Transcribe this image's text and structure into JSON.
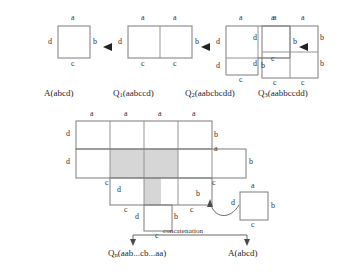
{
  "figure": {
    "title_present": false,
    "edge_labels": {
      "top": "a",
      "right": "b",
      "bottom": "c",
      "left": "d"
    },
    "top_row": {
      "steps": [
        {
          "id": "step-A",
          "caption_main": "A",
          "caption_sub": "",
          "caption_word": "(abcd)",
          "word": "abcd",
          "cols": 1,
          "rows": 1,
          "labels": [
            {
              "text": "a",
              "pos": "top"
            },
            {
              "text": "b",
              "pos": "right"
            },
            {
              "text": "c",
              "pos": "bottom"
            },
            {
              "text": "d",
              "pos": "left"
            }
          ]
        },
        {
          "id": "step-Q1",
          "caption_main": "Q",
          "caption_sub": "1",
          "caption_word": "(aabccd)",
          "word": "aabccd",
          "cols": 2,
          "rows": 1,
          "labels": [
            {
              "text": "a",
              "pos": "top-left"
            },
            {
              "text": "a",
              "pos": "top-right"
            },
            {
              "text": "b",
              "pos": "right"
            },
            {
              "text": "c",
              "pos": "bottom-left"
            },
            {
              "text": "c",
              "pos": "bottom-right"
            },
            {
              "text": "d",
              "pos": "left"
            }
          ]
        },
        {
          "id": "step-Q2",
          "caption_main": "Q",
          "caption_sub": "2",
          "caption_word": "(aabcbcdd)",
          "word": "aabcbcdd",
          "cols": 2,
          "rows": 2,
          "labels": [
            {
              "text": "a",
              "pos": "top-left"
            },
            {
              "text": "a",
              "pos": "top-right"
            },
            {
              "text": "b",
              "pos": "right-upper"
            },
            {
              "text": "c",
              "pos": "mid-right"
            },
            {
              "text": "b",
              "pos": "right-lower"
            },
            {
              "text": "c",
              "pos": "bottom-left"
            },
            {
              "text": "d",
              "pos": "left-upper"
            },
            {
              "text": "d",
              "pos": "left-lower"
            }
          ]
        },
        {
          "id": "step-Q3",
          "caption_main": "Q",
          "caption_sub": "3",
          "caption_word": "(aabbccdd)",
          "word": "aabbccdd",
          "cols": 2,
          "rows": 2,
          "labels": [
            {
              "text": "a",
              "pos": "top-left"
            },
            {
              "text": "a",
              "pos": "top-right"
            },
            {
              "text": "b",
              "pos": "right-upper"
            },
            {
              "text": "b",
              "pos": "right-lower"
            },
            {
              "text": "c",
              "pos": "bottom-left"
            },
            {
              "text": "c",
              "pos": "bottom-right"
            },
            {
              "text": "d",
              "pos": "left-upper"
            },
            {
              "text": "d",
              "pos": "left-lower"
            }
          ]
        }
      ],
      "arrow_glyph": "▶"
    },
    "bottom_figure": {
      "id": "polyomino-figure",
      "shaded_color": "#d6d6d6",
      "caption_main": "Q",
      "caption_sub": "n",
      "caption_word": "(aab...cb...aa)",
      "small_square": {
        "id": "small-square-A",
        "caption_main": "A",
        "caption_sub": "",
        "caption_word": "(abcd)",
        "labels": [
          {
            "text": "a",
            "pos": "top"
          },
          {
            "text": "b",
            "pos": "right"
          },
          {
            "text": "c",
            "pos": "bottom"
          },
          {
            "text": "d",
            "pos": "left"
          }
        ]
      },
      "labels": [
        {
          "text": "a",
          "pos": "top-1"
        },
        {
          "text": "a",
          "pos": "top-2"
        },
        {
          "text": "a",
          "pos": "top-3"
        },
        {
          "text": "a",
          "pos": "top-4"
        },
        {
          "text": "b",
          "pos": "right-row1"
        },
        {
          "text": "a",
          "pos": "right-notch-top"
        },
        {
          "text": "b",
          "pos": "right-row2"
        },
        {
          "text": "c",
          "pos": "right-row2-bottom"
        },
        {
          "text": "b",
          "pos": "right-row3"
        },
        {
          "text": "c",
          "pos": "right-row3-bottom"
        },
        {
          "text": "c",
          "pos": "bottom-stem-left"
        },
        {
          "text": "b",
          "pos": "stem-right"
        },
        {
          "text": "d",
          "pos": "stem-left"
        },
        {
          "text": "c",
          "pos": "stem-bottom"
        },
        {
          "text": "c",
          "pos": "left-notch-bottom"
        },
        {
          "text": "d",
          "pos": "left-row1"
        },
        {
          "text": "d",
          "pos": "left-row2"
        },
        {
          "text": "d",
          "pos": "left-row3"
        }
      ]
    },
    "concatenation": {
      "label": "concatenation",
      "left_target": "Q",
      "right_target": "A"
    }
  }
}
